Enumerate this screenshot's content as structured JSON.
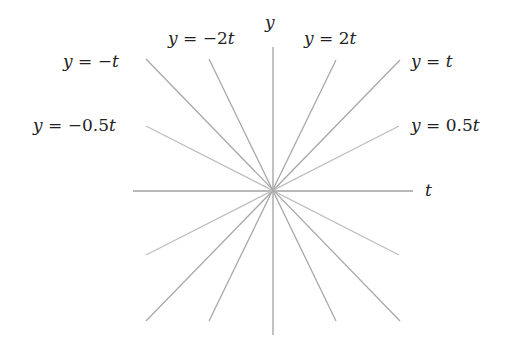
{
  "diagram": {
    "type": "line-family",
    "origin_px": [
      273,
      191
    ],
    "colors": {
      "axis": "#a0a0a0",
      "line": "#a8a8a8",
      "line_light": "#bdbdbd",
      "text": "#222222",
      "background": "#ffffff"
    },
    "axes": {
      "horizontal": {
        "label": "t",
        "from": [
          133,
          191
        ],
        "to": [
          413,
          191
        ]
      },
      "vertical": {
        "label": "y",
        "from": [
          273,
          47
        ],
        "to": [
          273,
          335
        ]
      }
    },
    "lines": [
      {
        "name": "y = 2t",
        "slope": 2,
        "from": [
          209,
          321
        ],
        "to": [
          336,
          60
        ],
        "label": "y = 2t"
      },
      {
        "name": "y = t",
        "slope": 1,
        "from": [
          146,
          321
        ],
        "to": [
          400,
          60
        ],
        "label": "y = t"
      },
      {
        "name": "y = 0.5t",
        "slope": 0.5,
        "from": [
          146,
          255
        ],
        "to": [
          399,
          126
        ],
        "label": "y = 0.5t"
      },
      {
        "name": "y = -0.5t",
        "slope": -0.5,
        "from": [
          146,
          126
        ],
        "to": [
          399,
          255
        ],
        "label": "y = −0.5t"
      },
      {
        "name": "y = -t",
        "slope": -1,
        "from": [
          146,
          59
        ],
        "to": [
          400,
          321
        ],
        "label": "y = −t"
      },
      {
        "name": "y = -2t",
        "slope": -2,
        "from": [
          209,
          59
        ],
        "to": [
          336,
          321
        ],
        "label": "y = −2t"
      }
    ],
    "labels": {
      "t_axis": "t",
      "y_axis": "y",
      "y_eq_2t": {
        "lhs": "y",
        "eq": " = ",
        "rhs": "2",
        "var": "t"
      },
      "y_eq_t": {
        "lhs": "y",
        "eq": " = ",
        "rhs": "",
        "var": "t"
      },
      "y_eq_0_5t": {
        "lhs": "y",
        "eq": " = ",
        "rhs": "0.5",
        "var": "t"
      },
      "y_eq_neg_0_5t": {
        "lhs": "y",
        "eq": " = ",
        "rhs": "−0.5",
        "var": "t"
      },
      "y_eq_neg_t": {
        "lhs": "y",
        "eq": " = ",
        "rhs": "−",
        "var": "t"
      },
      "y_eq_neg_2t": {
        "lhs": "y",
        "eq": " = ",
        "rhs": "−2",
        "var": "t"
      }
    }
  }
}
